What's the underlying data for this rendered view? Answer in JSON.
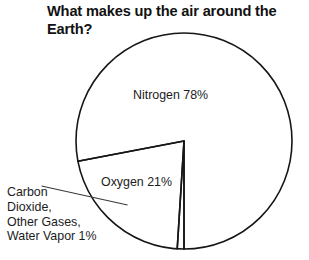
{
  "figure": {
    "title": "What makes up the air around the Earth?",
    "title_line_1": "What makes up the air around",
    "title_line_2": "the Earth?",
    "background_color": "#ffffff",
    "stroke_color": "#161616",
    "text_color": "#1c1c1c"
  },
  "labels": {
    "nitrogen": "Nitrogen 78%",
    "oxygen": "Oxygen 21%",
    "trace": "Carbon\nDioxide,\nOther Gases,\nWater Vapor 1%",
    "trace_line_1": "Carbon",
    "trace_line_2": "Dioxide,",
    "trace_line_3": "Other Gases,",
    "trace_line_4": "Water Vapor 1%"
  },
  "chart_data": {
    "type": "pie",
    "title": "What makes up the air around the Earth?",
    "categories": [
      "Nitrogen",
      "Oxygen",
      "Carbon Dioxide, Other Gases, Water Vapor"
    ],
    "values": [
      78,
      21,
      1
    ],
    "unit": "%",
    "labels": [
      "Nitrogen 78%",
      "Oxygen 21%",
      "Carbon Dioxide, Other Gases, Water Vapor 1%"
    ],
    "slice_fill": [
      "none",
      "none",
      "none"
    ],
    "slice_stroke": "#161616",
    "legend": "none",
    "legend_position": "inline-labels",
    "grid": false,
    "geometry": {
      "center_x": 184,
      "center_y": 141,
      "radius": 108,
      "start_angle_deg": 90,
      "direction": "counterclockwise",
      "slice_boundaries_deg": [
        90,
        370.8,
        374.4,
        450
      ]
    },
    "xlabel": "",
    "ylabel": ""
  }
}
